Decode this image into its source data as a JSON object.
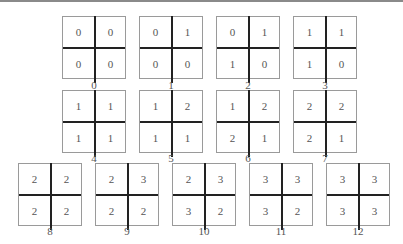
{
  "figure": {
    "rows": [
      {
        "top": 16,
        "label_top": 79,
        "items": [
          {
            "label": "0",
            "x": 62,
            "cells": [
              "0",
              "0",
              "0",
              "0"
            ]
          },
          {
            "label": "1",
            "x": 139,
            "cells": [
              "0",
              "1",
              "0",
              "0"
            ]
          },
          {
            "label": "2",
            "x": 216,
            "cells": [
              "0",
              "1",
              "1",
              "0"
            ]
          },
          {
            "label": "3",
            "x": 293,
            "cells": [
              "1",
              "1",
              "1",
              "0"
            ]
          }
        ]
      },
      {
        "top": 90,
        "label_top": 152,
        "items": [
          {
            "label": "4",
            "x": 62,
            "cells": [
              "1",
              "1",
              "1",
              "1"
            ]
          },
          {
            "label": "5",
            "x": 139,
            "cells": [
              "1",
              "2",
              "1",
              "1"
            ]
          },
          {
            "label": "6",
            "x": 216,
            "cells": [
              "1",
              "2",
              "2",
              "1"
            ]
          },
          {
            "label": "7",
            "x": 293,
            "cells": [
              "2",
              "2",
              "2",
              "1"
            ]
          }
        ]
      },
      {
        "top": 163,
        "label_top": 225,
        "items": [
          {
            "label": "8",
            "x": 18,
            "cells": [
              "2",
              "2",
              "2",
              "2"
            ]
          },
          {
            "label": "9",
            "x": 95,
            "cells": [
              "2",
              "3",
              "2",
              "2"
            ]
          },
          {
            "label": "10",
            "x": 172,
            "cells": [
              "2",
              "3",
              "3",
              "2"
            ]
          },
          {
            "label": "11",
            "x": 249,
            "cells": [
              "3",
              "3",
              "3",
              "2"
            ]
          },
          {
            "label": "12",
            "x": 326,
            "cells": [
              "3",
              "3",
              "3",
              "3"
            ]
          }
        ]
      }
    ]
  }
}
